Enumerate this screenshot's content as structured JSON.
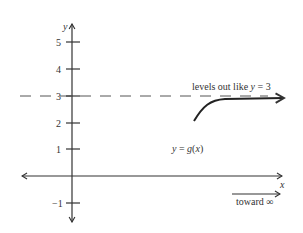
{
  "axes": {
    "x_label": "x",
    "y_label": "y",
    "y_ticks": [
      {
        "value": 5,
        "label": "5"
      },
      {
        "value": 4,
        "label": "4"
      },
      {
        "value": 3,
        "label": "3"
      },
      {
        "value": 2,
        "label": "2"
      },
      {
        "value": 1,
        "label": "1"
      },
      {
        "value": -1,
        "label": "−1"
      }
    ]
  },
  "asymptote": {
    "y": 3,
    "label_prefix": "levels out like ",
    "label_var": "y",
    "label_suffix": " = 3"
  },
  "curve": {
    "label_lhs": "y",
    "label_eq": " = ",
    "label_func": "g",
    "label_open": "(",
    "label_arg": "x",
    "label_close": ")"
  },
  "direction_note": {
    "label": "toward ∞"
  },
  "colors": {
    "ink": "#333333",
    "dash": "#555555",
    "background": "#ffffff"
  }
}
